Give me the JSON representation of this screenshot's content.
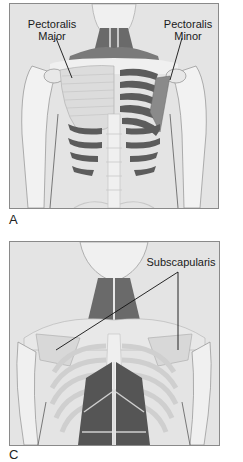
{
  "figure": {
    "panels": [
      {
        "id": "A",
        "letter": "A",
        "labels": [
          {
            "line1": "Pectoralis",
            "line2": "Major"
          },
          {
            "line1": "Pectoralis",
            "line2": "Minor"
          }
        ]
      },
      {
        "id": "B",
        "letter": "C",
        "labels": [
          {
            "line1": "Subscapularis"
          }
        ]
      }
    ],
    "colors": {
      "background": "#e4e4e4",
      "bone": "#f2f2f2",
      "bone_outline": "#b8b8b8",
      "muscle_dark": "#5a5a5a",
      "muscle_light": "#d8d8d8",
      "frame": "#8a8a8a",
      "leader_line": "#111111"
    }
  }
}
